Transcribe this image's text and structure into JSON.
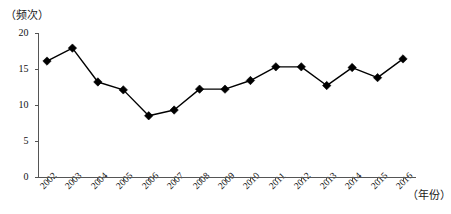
{
  "chart_data": {
    "type": "line",
    "title": "",
    "subtitle": "",
    "xlabel": "（年份）",
    "ylabel": "（频次）",
    "x": [
      2002,
      2003,
      2004,
      2005,
      2006,
      2007,
      2008,
      2009,
      2010,
      2011,
      2012,
      2013,
      2014,
      2015,
      2016
    ],
    "categories": [
      "2002",
      "2003",
      "2004",
      "2005",
      "2006",
      "2007",
      "2008",
      "2009",
      "2010",
      "2011",
      "2012",
      "2013",
      "2014",
      "2015",
      "2016"
    ],
    "values": [
      16.1,
      17.9,
      13.2,
      12.1,
      8.5,
      9.3,
      12.2,
      12.2,
      13.4,
      15.3,
      15.3,
      12.7,
      15.2,
      13.8,
      16.4
    ],
    "series": [
      {
        "name": "频次",
        "values": [
          16.1,
          17.9,
          13.2,
          12.1,
          8.5,
          9.3,
          12.2,
          12.2,
          13.4,
          15.3,
          15.3,
          12.7,
          15.2,
          13.8,
          16.4
        ],
        "marker": "diamond",
        "color": "#000000"
      }
    ],
    "ylim": [
      0,
      20
    ],
    "yticks": [
      0,
      5,
      10,
      15,
      20
    ],
    "ytick_labels": [
      "0",
      "5",
      "10",
      "15",
      "20"
    ],
    "xtick_labels": [
      "2002",
      "2003",
      "2004",
      "2005",
      "2006",
      "2007",
      "2008",
      "2009",
      "2010",
      "2011",
      "2012",
      "2013",
      "2014",
      "2015",
      "2016"
    ],
    "grid": false,
    "legend": false,
    "legend_position": "none",
    "axis_color": "#555555",
    "line_color": "#000000",
    "marker_color": "#000000",
    "background": "#ffffff"
  }
}
